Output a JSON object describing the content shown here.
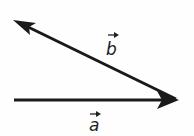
{
  "diagram": {
    "type": "vector-diagram",
    "vectors": [
      {
        "id": "a",
        "label": "a",
        "notation": "a with arrow",
        "direction": "right"
      },
      {
        "id": "b",
        "label": "b",
        "notation": "b with arrow",
        "direction": "up-left",
        "shares_tail_with_head_of": "a"
      }
    ]
  },
  "colors": {
    "stroke": "#1a1a1a",
    "background": "#fefefe"
  }
}
